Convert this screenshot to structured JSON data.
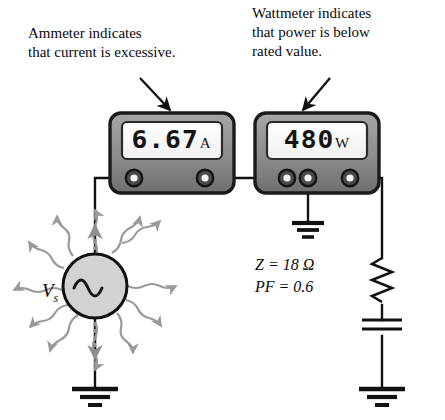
{
  "figure": {
    "type": "circuit-diagram"
  },
  "annotations": {
    "ammeter_note": "Ammeter indicates\nthat current is excessive.",
    "wattmeter_note": "Wattmeter indicates\nthat power is below\nrated value."
  },
  "meters": {
    "ammeter": {
      "name": "Ammeter",
      "reading": "6.67",
      "unit": "A",
      "terminal_count": 2
    },
    "wattmeter": {
      "name": "Wattmeter",
      "reading": "480",
      "unit": "W",
      "terminal_count": 3
    }
  },
  "source": {
    "label": "V",
    "subscript": "s",
    "symbol": "ac-sine"
  },
  "load": {
    "impedance": "Z = 18 Ω",
    "power_factor": "PF = 0.6",
    "elements": [
      "resistor",
      "capacitor"
    ]
  },
  "grounds": [
    {
      "id": "source-ground"
    },
    {
      "id": "wattmeter-ground"
    },
    {
      "id": "load-ground"
    }
  ],
  "colors": {
    "wire": "#121212",
    "meter_body": "#8c8c8c",
    "meter_border": "#1b1b1b",
    "lcd_background": "#ffffff",
    "source_fill": "#d2d2d2",
    "radiation_arrow": "#9a9a9a",
    "text": "#0a0a0a"
  }
}
